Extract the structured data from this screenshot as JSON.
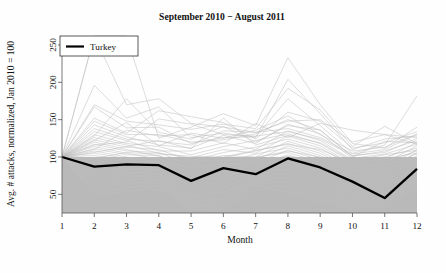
{
  "chart_data": {
    "type": "line",
    "title": "September 2010 − August 2011",
    "xlabel": "Month",
    "ylabel": "Avg. # attacks, normalized, Jan 2010 = 100",
    "xlim": [
      1,
      12
    ],
    "ylim": [
      25,
      262
    ],
    "xticks": [
      1,
      2,
      3,
      4,
      5,
      6,
      7,
      8,
      9,
      10,
      11,
      12
    ],
    "xtick_labels": [
      "1",
      "2",
      "3",
      "4",
      "5",
      "6",
      "7",
      "8",
      "9",
      "10",
      "11",
      "12"
    ],
    "yticks": [
      50,
      100,
      150,
      200,
      250
    ],
    "ytick_labels": [
      "50",
      "100",
      "150",
      "200",
      "250"
    ],
    "grid": false,
    "legend": {
      "position": "top-left",
      "entries": [
        {
          "label": "Turkey",
          "color": "#000000",
          "linewidth": 2.2
        }
      ]
    },
    "shaded_band": {
      "label": "interquartile background band",
      "color": "#b9b9b9",
      "y_from": 25,
      "y_to": 100
    },
    "x": [
      1,
      2,
      3,
      4,
      5,
      6,
      7,
      8,
      9,
      10,
      11,
      12
    ],
    "series": [
      {
        "name": "Turkey",
        "highlight": true,
        "color": "#000000",
        "values": [
          100,
          87,
          90,
          89,
          68,
          85,
          77,
          98,
          86,
          67,
          45,
          84
        ]
      },
      {
        "name": "country-001",
        "color": "#bdbdbd",
        "values": [
          100,
          268,
          170,
          178,
          145,
          140,
          133,
          148,
          150,
          120,
          130,
          126
        ]
      },
      {
        "name": "country-002",
        "color": "#bdbdbd",
        "values": [
          100,
          262,
          268,
          125,
          140,
          158,
          142,
          233,
          170,
          118,
          112,
          140
        ]
      },
      {
        "name": "country-003",
        "color": "#bdbdbd",
        "values": [
          100,
          196,
          152,
          167,
          126,
          132,
          126,
          204,
          158,
          110,
          124,
          128
        ]
      },
      {
        "name": "country-004",
        "color": "#bdbdbd",
        "values": [
          100,
          170,
          148,
          143,
          137,
          144,
          138,
          192,
          163,
          114,
          141,
          118
        ]
      },
      {
        "name": "country-005",
        "color": "#bdbdbd",
        "values": [
          100,
          167,
          139,
          140,
          118,
          126,
          127,
          178,
          142,
          105,
          116,
          182
        ]
      },
      {
        "name": "country-006",
        "color": "#bdbdbd",
        "values": [
          100,
          152,
          132,
          162,
          154,
          146,
          124,
          160,
          148,
          112,
          119,
          134
        ]
      },
      {
        "name": "country-007",
        "color": "#bdbdbd",
        "values": [
          100,
          148,
          130,
          130,
          120,
          123,
          131,
          150,
          136,
          101,
          108,
          122
        ]
      },
      {
        "name": "country-008",
        "color": "#bdbdbd",
        "values": [
          100,
          143,
          127,
          116,
          112,
          129,
          118,
          144,
          131,
          98,
          104,
          117
        ]
      },
      {
        "name": "country-009",
        "color": "#bdbdbd",
        "values": [
          100,
          138,
          124,
          121,
          116,
          135,
          133,
          138,
          126,
          104,
          110,
          130
        ]
      },
      {
        "name": "country-010",
        "color": "#bdbdbd",
        "values": [
          100,
          134,
          122,
          108,
          108,
          119,
          110,
          135,
          122,
          96,
          100,
          112
        ]
      },
      {
        "name": "country-011",
        "color": "#bdbdbd",
        "values": [
          100,
          130,
          118,
          114,
          103,
          114,
          122,
          131,
          118,
          93,
          97,
          120
        ]
      },
      {
        "name": "country-012",
        "color": "#bdbdbd",
        "values": [
          100,
          126,
          116,
          105,
          99,
          110,
          105,
          128,
          115,
          90,
          94,
          108
        ]
      },
      {
        "name": "country-013",
        "color": "#bdbdbd",
        "values": [
          100,
          123,
          113,
          110,
          95,
          106,
          113,
          124,
          112,
          88,
          92,
          115
        ]
      },
      {
        "name": "country-014",
        "color": "#bdbdbd",
        "values": [
          100,
          120,
          110,
          101,
          92,
          102,
          100,
          121,
          108,
          85,
          89,
          104
        ]
      },
      {
        "name": "country-015",
        "color": "#bdbdbd",
        "values": [
          100,
          117,
          108,
          106,
          89,
          99,
          108,
          118,
          105,
          83,
          86,
          110
        ]
      },
      {
        "name": "country-016",
        "color": "#bdbdbd",
        "values": [
          100,
          114,
          105,
          97,
          86,
          95,
          96,
          115,
          102,
          80,
          84,
          100
        ]
      },
      {
        "name": "country-017",
        "color": "#bdbdbd",
        "values": [
          100,
          111,
          103,
          102,
          83,
          92,
          104,
          112,
          99,
          78,
          81,
          106
        ]
      },
      {
        "name": "country-018",
        "color": "#bdbdbd",
        "values": [
          100,
          108,
          100,
          93,
          80,
          88,
          92,
          109,
          96,
          75,
          79,
          96
        ]
      },
      {
        "name": "country-019",
        "color": "#bdbdbd",
        "values": [
          100,
          105,
          98,
          98,
          77,
          85,
          100,
          106,
          93,
          73,
          76,
          102
        ]
      },
      {
        "name": "country-020",
        "color": "#bdbdbd",
        "values": [
          100,
          102,
          95,
          89,
          74,
          81,
          88,
          103,
          90,
          70,
          74,
          92
        ]
      },
      {
        "name": "country-021",
        "color": "#bdbdbd",
        "values": [
          100,
          99,
          93,
          94,
          71,
          78,
          96,
          100,
          87,
          68,
          71,
          98
        ]
      },
      {
        "name": "country-022",
        "color": "#bdbdbd",
        "values": [
          100,
          96,
          90,
          85,
          68,
          74,
          84,
          97,
          84,
          65,
          69,
          88
        ]
      },
      {
        "name": "country-023",
        "color": "#bdbdbd",
        "values": [
          100,
          93,
          88,
          90,
          65,
          71,
          92,
          94,
          81,
          63,
          66,
          94
        ]
      },
      {
        "name": "country-024",
        "color": "#bdbdbd",
        "values": [
          100,
          90,
          85,
          81,
          62,
          67,
          80,
          91,
          78,
          60,
          64,
          84
        ]
      },
      {
        "name": "country-025",
        "color": "#bdbdbd",
        "values": [
          100,
          87,
          83,
          86,
          59,
          64,
          88,
          88,
          75,
          58,
          61,
          90
        ]
      },
      {
        "name": "country-026",
        "color": "#bdbdbd",
        "values": [
          100,
          84,
          80,
          77,
          56,
          60,
          76,
          85,
          72,
          55,
          59,
          80
        ]
      },
      {
        "name": "country-027",
        "color": "#bdbdbd",
        "values": [
          100,
          81,
          78,
          82,
          53,
          57,
          84,
          82,
          69,
          53,
          56,
          86
        ]
      },
      {
        "name": "country-028",
        "color": "#bdbdbd",
        "values": [
          100,
          78,
          75,
          73,
          50,
          53,
          72,
          79,
          66,
          50,
          54,
          76
        ]
      },
      {
        "name": "country-029",
        "color": "#bdbdbd",
        "values": [
          100,
          75,
          73,
          78,
          47,
          50,
          80,
          76,
          63,
          48,
          51,
          82
        ]
      },
      {
        "name": "country-030",
        "color": "#bdbdbd",
        "values": [
          100,
          72,
          70,
          69,
          44,
          46,
          68,
          73,
          60,
          45,
          49,
          72
        ]
      },
      {
        "name": "country-031",
        "color": "#bdbdbd",
        "values": [
          100,
          69,
          68,
          74,
          41,
          43,
          76,
          70,
          57,
          43,
          46,
          78
        ]
      },
      {
        "name": "country-032",
        "color": "#bdbdbd",
        "values": [
          100,
          66,
          65,
          65,
          38,
          39,
          64,
          67,
          54,
          40,
          44,
          68
        ]
      },
      {
        "name": "country-033",
        "color": "#bdbdbd",
        "values": [
          100,
          63,
          63,
          70,
          36,
          36,
          72,
          64,
          51,
          38,
          41,
          74
        ]
      },
      {
        "name": "country-034",
        "color": "#bdbdbd",
        "values": [
          100,
          60,
          60,
          61,
          34,
          33,
          60,
          61,
          48,
          35,
          39,
          64
        ]
      },
      {
        "name": "country-035",
        "color": "#bdbdbd",
        "values": [
          100,
          57,
          58,
          66,
          32,
          31,
          68,
          58,
          45,
          33,
          36,
          70
        ]
      },
      {
        "name": "country-036",
        "color": "#bdbdbd",
        "values": [
          100,
          54,
          55,
          57,
          30,
          29,
          56,
          55,
          42,
          31,
          34,
          60
        ]
      },
      {
        "name": "country-037",
        "color": "#bdbdbd",
        "values": [
          100,
          51,
          53,
          62,
          48,
          55,
          64,
          52,
          39,
          29,
          32,
          66
        ]
      },
      {
        "name": "country-038",
        "color": "#bdbdbd",
        "values": [
          100,
          110,
          136,
          128,
          130,
          118,
          145,
          126,
          145,
          136,
          130,
          117
        ]
      },
      {
        "name": "country-039",
        "color": "#bdbdbd",
        "values": [
          100,
          128,
          178,
          133,
          124,
          141,
          120,
          142,
          136,
          100,
          121,
          119
        ]
      },
      {
        "name": "country-040",
        "color": "#bdbdbd",
        "values": [
          100,
          122,
          146,
          115,
          132,
          125,
          136,
          155,
          130,
          108,
          113,
          131
        ]
      },
      {
        "name": "country-041",
        "color": "#bdbdbd",
        "values": [
          100,
          116,
          120,
          151,
          144,
          130,
          128,
          134,
          124,
          102,
          106,
          125
        ]
      },
      {
        "name": "country-042",
        "color": "#bdbdbd",
        "values": [
          100,
          106,
          114,
          122,
          111,
          152,
          116,
          129,
          119,
          95,
          103,
          109
        ]
      },
      {
        "name": "country-043",
        "color": "#bdbdbd",
        "values": [
          100,
          98,
          106,
          104,
          101,
          100,
          109,
          117,
          110,
          92,
          98,
          105
        ]
      },
      {
        "name": "country-044",
        "color": "#bdbdbd",
        "values": [
          100,
          92,
          97,
          99,
          94,
          96,
          99,
          108,
          100,
          86,
          90,
          99
        ]
      },
      {
        "name": "country-045",
        "color": "#bdbdbd",
        "values": [
          100,
          88,
          92,
          92,
          87,
          90,
          94,
          101,
          94,
          81,
          85,
          93
        ]
      }
    ]
  }
}
